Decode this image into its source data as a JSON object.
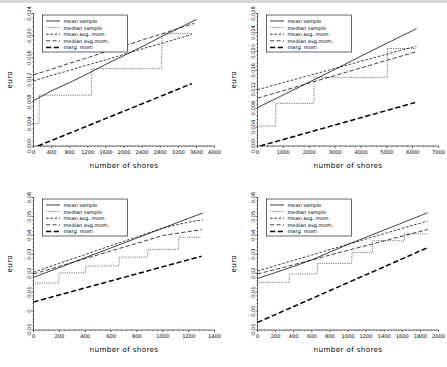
{
  "figure": {
    "layout": "2x2 grid of line charts",
    "background_color": "#ffffff",
    "line_color": "#000000",
    "panel_count": 4
  },
  "legend": {
    "position": "upper-left inside axes",
    "entries": [
      {
        "label": "mean sample",
        "style": "solid"
      },
      {
        "label": "median sample",
        "style": "dotted"
      },
      {
        "label": "mean avg. mom.",
        "style": "dashed-short"
      },
      {
        "label": "median    avg.mom.",
        "style": "dashed-medium"
      },
      {
        "label": "marg. mom",
        "style": "dashed-bold-long"
      }
    ]
  },
  "chart_data": [
    {
      "type": "line",
      "panel": "top-left",
      "title": "",
      "xlabel": "number of shores",
      "ylabel": "euro",
      "xlim": [
        0,
        4000
      ],
      "ylim": [
        0.0,
        0.024
      ],
      "xticks": [
        0,
        400,
        800,
        1200,
        1600,
        2000,
        2400,
        2800,
        3200,
        3600,
        4000
      ],
      "xtick_labels": [
        "0",
        "400",
        "800",
        "1200",
        "1600",
        "2000",
        "2400",
        "2800",
        "3200",
        "3600",
        "4000"
      ],
      "yticks": [
        0.0,
        0.004,
        0.008,
        0.012,
        0.016,
        0.02,
        0.024
      ],
      "ytick_labels": [
        "0.000",
        "0.004",
        "0.008",
        "0.012",
        "0.016",
        "0.020",
        "0.024"
      ],
      "grid": false,
      "series": [
        {
          "name": "mean sample",
          "style": "solid",
          "x": [
            0,
            400,
            800,
            1200,
            1600,
            2000,
            2400,
            2800,
            3200,
            3600
          ],
          "y": [
            0.0082,
            0.01,
            0.0115,
            0.0131,
            0.0148,
            0.0164,
            0.018,
            0.0197,
            0.0213,
            0.0229
          ]
        },
        {
          "name": "median sample",
          "style": "dotted",
          "x": [
            0,
            120,
            130,
            1280,
            1290,
            2830,
            2840,
            3500
          ],
          "y": [
            0.004,
            0.004,
            0.0092,
            0.0092,
            0.014,
            0.014,
            0.0204,
            0.0204
          ]
        },
        {
          "name": "mean avg. mom.",
          "style": "dashed-short",
          "x": [
            0,
            400,
            800,
            1200,
            1600,
            2000,
            2400,
            2800,
            3200,
            3500
          ],
          "y": [
            0.0118,
            0.0128,
            0.0137,
            0.0147,
            0.0156,
            0.0166,
            0.0176,
            0.0185,
            0.0195,
            0.0202
          ]
        },
        {
          "name": "median    avg.mom.",
          "style": "dashed-medium",
          "x": [
            0,
            400,
            800,
            1200,
            1600,
            2000,
            2400,
            2800,
            3200,
            3550
          ],
          "y": [
            0.0129,
            0.0139,
            0.015,
            0.016,
            0.0171,
            0.0181,
            0.0192,
            0.0202,
            0.0213,
            0.0222
          ]
        },
        {
          "name": "marg. mom",
          "style": "dashed-bold-long",
          "x": [
            100,
            3500
          ],
          "y": [
            0.0,
            0.0113
          ]
        }
      ]
    },
    {
      "type": "line",
      "panel": "top-right",
      "title": "",
      "xlabel": "number of shores",
      "ylabel": "euro",
      "xlim": [
        0,
        7000
      ],
      "ylim": [
        0.0,
        0.028
      ],
      "xticks": [
        0,
        1000,
        2000,
        3000,
        4000,
        5000,
        6000,
        7000
      ],
      "xtick_labels": [
        "0",
        "1000",
        "2000",
        "3000",
        "4000",
        "5000",
        "6000",
        "7000"
      ],
      "yticks": [
        0.0,
        0.004,
        0.008,
        0.012,
        0.016,
        0.02,
        0.024,
        0.028
      ],
      "ytick_labels": [
        "0.000",
        "0.004",
        "0.008",
        "0.012",
        "0.016",
        "0.020",
        "0.024",
        "0.028"
      ],
      "grid": false,
      "series": [
        {
          "name": "mean sample",
          "style": "solid",
          "x": [
            0,
            1000,
            2000,
            3000,
            4000,
            5000,
            6000,
            6150
          ],
          "y": [
            0.0081,
            0.0108,
            0.0135,
            0.0162,
            0.019,
            0.0217,
            0.0244,
            0.0248
          ]
        },
        {
          "name": "median sample",
          "style": "dotted",
          "x": [
            0,
            700,
            710,
            2180,
            2190,
            5020,
            5030,
            6150
          ],
          "y": [
            0.0042,
            0.0042,
            0.009,
            0.009,
            0.0145,
            0.0145,
            0.0206,
            0.0206
          ]
        },
        {
          "name": "mean avg. mom.",
          "style": "dashed-short",
          "x": [
            0,
            1000,
            2000,
            3000,
            4000,
            5000,
            6000,
            6150
          ],
          "y": [
            0.0119,
            0.0134,
            0.0149,
            0.0164,
            0.0179,
            0.0194,
            0.0209,
            0.0211
          ]
        },
        {
          "name": "median    avg.mom.",
          "style": "dashed-medium",
          "x": [
            0,
            1000,
            2000,
            3000,
            4000,
            5000,
            6000,
            6150
          ],
          "y": [
            0.0101,
            0.0117,
            0.0133,
            0.0149,
            0.0165,
            0.0181,
            0.0197,
            0.0199
          ]
        },
        {
          "name": "marg. mom",
          "style": "dashed-bold-long",
          "x": [
            100,
            6100
          ],
          "y": [
            0.0,
            0.0092
          ]
        }
      ]
    },
    {
      "type": "line",
      "panel": "bottom-left",
      "title": "",
      "xlabel": "number of shores",
      "ylabel": "euro",
      "xlim": [
        0,
        1400
      ],
      "ylim": [
        -0.01,
        0.06
      ],
      "xticks": [
        0,
        200,
        400,
        600,
        800,
        1000,
        1200,
        1400
      ],
      "xtick_labels": [
        "0",
        "200",
        "400",
        "600",
        "800",
        "1000",
        "1200",
        "1400"
      ],
      "yticks": [
        -0.01,
        0.0,
        0.01,
        0.02,
        0.03,
        0.04,
        0.05,
        0.06
      ],
      "ytick_labels": [
        "-0.01",
        "0",
        "0.01",
        "0.02",
        "0.03",
        "0.04",
        "0.05",
        "0.06"
      ],
      "grid": false,
      "series": [
        {
          "name": "mean sample",
          "style": "solid",
          "x": [
            0,
            200,
            400,
            600,
            800,
            1000,
            1200,
            1310
          ],
          "y": [
            0.0178,
            0.023,
            0.0282,
            0.0334,
            0.0386,
            0.0438,
            0.049,
            0.0518
          ]
        },
        {
          "name": "median sample",
          "style": "dotted",
          "x": [
            0,
            195,
            200,
            400,
            405,
            660,
            665,
            880,
            885,
            1120,
            1125,
            1300
          ],
          "y": [
            0.0148,
            0.0148,
            0.0202,
            0.0202,
            0.0238,
            0.0238,
            0.0285,
            0.0285,
            0.0325,
            0.0325,
            0.039,
            0.039
          ]
        },
        {
          "name": "mean avg. mom.",
          "style": "dashed-short",
          "x": [
            0,
            200,
            400,
            600,
            800,
            1000,
            1200,
            1310
          ],
          "y": [
            0.0205,
            0.0252,
            0.0299,
            0.0346,
            0.0392,
            0.0439,
            0.047,
            0.0482
          ]
        },
        {
          "name": "median    avg.mom.",
          "style": "dashed-medium",
          "x": [
            0,
            200,
            400,
            600,
            800,
            1000,
            1200,
            1300
          ],
          "y": [
            0.0196,
            0.0236,
            0.0277,
            0.0318,
            0.0358,
            0.0399,
            0.042,
            0.043
          ]
        },
        {
          "name": "marg. mom",
          "style": "dashed-bold-long",
          "x": [
            0,
            1300
          ],
          "y": [
            0.0048,
            0.029
          ]
        }
      ]
    },
    {
      "type": "line",
      "panel": "bottom-right",
      "title": "",
      "xlabel": "number of shores",
      "ylabel": "euro",
      "xlim": [
        0,
        2000
      ],
      "ylim": [
        -0.01,
        0.06
      ],
      "xticks": [
        0,
        200,
        400,
        600,
        800,
        1000,
        1200,
        1400,
        1600,
        1800,
        2000
      ],
      "xtick_labels": [
        "0",
        "200",
        "400",
        "600",
        "800",
        "1000",
        "1200",
        "1400",
        "1600",
        "1800",
        "2000"
      ],
      "yticks": [
        -0.01,
        0.0,
        0.01,
        0.02,
        0.03,
        0.04,
        0.05,
        0.06
      ],
      "ytick_labels": [
        "-0.01",
        "0.00",
        "0.01",
        "0.02",
        "0.03",
        "0.04",
        "0.05",
        "0.06"
      ],
      "grid": false,
      "series": [
        {
          "name": "mean sample",
          "style": "solid",
          "x": [
            0,
            200,
            400,
            600,
            800,
            1000,
            1200,
            1400,
            1600,
            1800,
            1880
          ],
          "y": [
            0.0172,
            0.0204,
            0.0236,
            0.027,
            0.0312,
            0.0352,
            0.039,
            0.0428,
            0.0466,
            0.0504,
            0.0519
          ]
        },
        {
          "name": "median sample",
          "style": "dotted",
          "x": [
            0,
            350,
            355,
            660,
            665,
            1040,
            1045,
            1270,
            1275,
            1620,
            1625,
            1880
          ],
          "y": [
            0.0152,
            0.0152,
            0.0196,
            0.0196,
            0.0252,
            0.0252,
            0.031,
            0.031,
            0.0372,
            0.0372,
            0.0408,
            0.0408
          ]
        },
        {
          "name": "mean avg. mom.",
          "style": "dashed-short",
          "x": [
            0,
            200,
            400,
            600,
            800,
            1000,
            1200,
            1400,
            1600,
            1800,
            1880
          ],
          "y": [
            0.0212,
            0.024,
            0.0268,
            0.0296,
            0.0325,
            0.0353,
            0.0381,
            0.0409,
            0.0437,
            0.0465,
            0.0476
          ]
        },
        {
          "name": "median    avg.mom.",
          "style": "dashed-medium",
          "x": [
            0,
            200,
            400,
            600,
            800,
            1000,
            1200,
            1400,
            1600,
            1800,
            1880
          ],
          "y": [
            0.0196,
            0.022,
            0.0245,
            0.027,
            0.0296,
            0.0321,
            0.0346,
            0.0371,
            0.0396,
            0.0421,
            0.0431
          ]
        },
        {
          "name": "marg. mom",
          "style": "dashed-bold-long",
          "x": [
            0,
            1880
          ],
          "y": [
            -0.006,
            0.0335
          ]
        }
      ]
    }
  ]
}
